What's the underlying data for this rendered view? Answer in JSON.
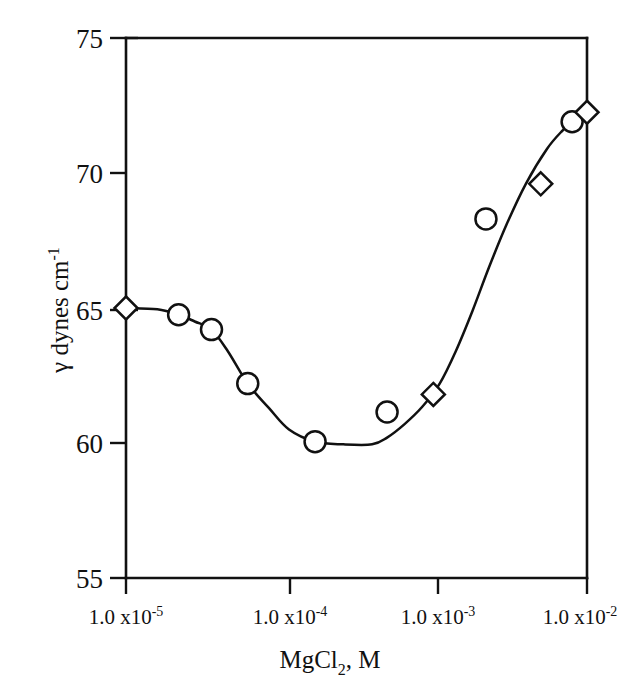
{
  "chart_data": {
    "type": "scatter",
    "title": "",
    "subtitle": "",
    "xlabel": "MgCl2, M",
    "xlabel_parts": {
      "pre": "MgCl",
      "sub": "2",
      "post": ", M"
    },
    "ylabel": "γ dynes cm-1",
    "ylabel_parts": {
      "pre": "γ dynes cm",
      "sup": "-1"
    },
    "xscale": "log",
    "yscale": "linear",
    "xlim": [
      1e-05,
      0.01
    ],
    "ylim": [
      55,
      75
    ],
    "grid": false,
    "legend": "none",
    "xticks": [
      1e-05,
      0.0001,
      0.001,
      0.01
    ],
    "xtick_labels": [
      {
        "mantissa": "1.0 x10",
        "exponent": "-5"
      },
      {
        "mantissa": "1.0 x10",
        "exponent": "-4"
      },
      {
        "mantissa": "1.0 x10",
        "exponent": "-3"
      },
      {
        "mantissa": "1.0 x10",
        "exponent": "-2"
      }
    ],
    "yticks": [
      55,
      60,
      65,
      70,
      75
    ],
    "ytick_labels": [
      "55",
      "60",
      "65",
      "70",
      "75"
    ],
    "series": [
      {
        "name": "circles",
        "marker": "circle",
        "x": [
          2.2e-05,
          3.6e-05,
          6.2e-05,
          0.00017,
          0.0005,
          0.0022,
          0.008
        ],
        "y": [
          64.75,
          64.2,
          62.2,
          60.05,
          61.15,
          68.3,
          71.9
        ]
      },
      {
        "name": "diamonds",
        "marker": "diamond",
        "x": [
          1e-05,
          0.001,
          0.005,
          0.01
        ],
        "y": [
          65.0,
          61.8,
          69.6,
          72.25
        ]
      }
    ],
    "fitted_curve": {
      "name": "fitted curve",
      "x": [
        1e-05,
        1.6e-05,
        2.2e-05,
        2.8e-05,
        3.6e-05,
        4.6e-05,
        6.2e-05,
        8.5e-05,
        0.000115,
        0.00017,
        0.00026,
        0.0004,
        0.0005,
        0.00065,
        0.00085,
        0.0011,
        0.0014,
        0.0018,
        0.0023,
        0.003,
        0.004,
        0.0055,
        0.007,
        0.0085,
        0.01
      ],
      "y": [
        65.0,
        64.95,
        64.75,
        64.5,
        64.2,
        63.4,
        62.2,
        61.3,
        60.5,
        60.05,
        59.95,
        59.95,
        60.2,
        60.7,
        61.35,
        62.2,
        63.4,
        64.9,
        66.5,
        68.1,
        69.6,
        70.9,
        71.6,
        72.05,
        72.3
      ]
    }
  },
  "geometry": {
    "plot_left": 126,
    "plot_right": 587,
    "plot_top": 38,
    "plot_bottom": 578
  }
}
